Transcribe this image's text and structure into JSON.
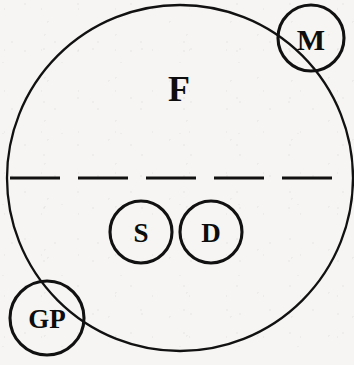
{
  "diagram": {
    "type": "venn-set-diagram",
    "canvas": {
      "width": 354,
      "height": 365
    },
    "background_color": "#f6f5f3",
    "stroke_color": "#111111",
    "outer_set": {
      "name": "outer-set-F",
      "label": "F",
      "label_x": 179,
      "label_y": 89,
      "cx": 180,
      "cy": 178,
      "r": 173
    },
    "divider": {
      "name": "horizontal-dashed-divider",
      "x1": 10,
      "x2": 350,
      "y": 178,
      "dash": "50 18"
    },
    "nodes": [
      {
        "id": "node-M",
        "label": "M",
        "cx": 311,
        "cy": 38,
        "r": 33,
        "position": "top-right-boundary",
        "label_x": 311,
        "label_y": 39
      },
      {
        "id": "node-GP",
        "label": "GP",
        "cx": 47,
        "cy": 318,
        "r": 37,
        "position": "bottom-left-boundary",
        "label_x": 47,
        "label_y": 319
      },
      {
        "id": "node-S",
        "label": "S",
        "cx": 141,
        "cy": 232,
        "r": 31,
        "position": "lower-half-interior",
        "label_x": 141,
        "label_y": 233
      },
      {
        "id": "node-D",
        "label": "D",
        "cx": 211,
        "cy": 232,
        "r": 31,
        "position": "lower-half-interior",
        "label_x": 211,
        "label_y": 233
      }
    ]
  }
}
